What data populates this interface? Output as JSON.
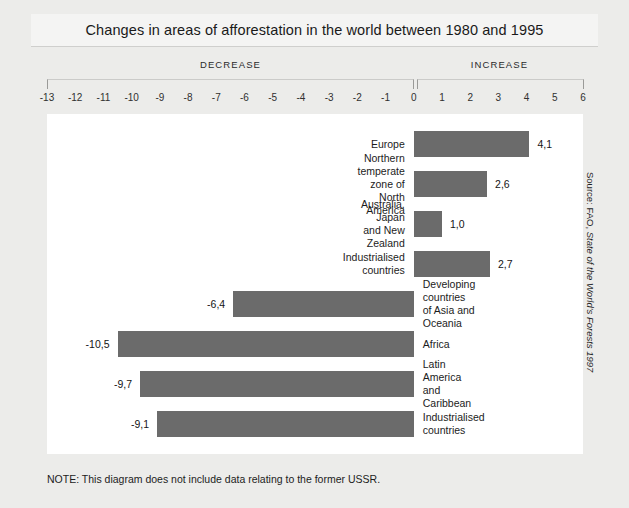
{
  "title": "Changes in areas of afforestation in the world between 1980 and 1995",
  "bands": {
    "decrease": "DECREASE",
    "increase": "INCREASE"
  },
  "note": "NOTE: This diagram does not include data relating to the former USSR.",
  "source_prefix": "Source: FAO, ",
  "source_italic": "State of the World's Forests 1997",
  "chart_data": {
    "type": "bar",
    "orientation": "horizontal",
    "title": "Changes in areas of afforestation in the world between 1980 and 1995",
    "xlabel": "",
    "ylabel": "",
    "xlim": [
      -13,
      6
    ],
    "grid": false,
    "legend": null,
    "bar_color": "#6b6b6b",
    "plot_background": "#ffffff",
    "figure_background": "#ececea",
    "tick_labels": [
      "-13",
      "-12",
      "-11",
      "-10",
      "-9",
      "-8",
      "-7",
      "-6",
      "-5",
      "-4",
      "-3",
      "-2",
      "-1",
      "0",
      "1",
      "2",
      "3",
      "4",
      "5",
      "6"
    ],
    "ticks": [
      -13,
      -12,
      -11,
      -10,
      -9,
      -8,
      -7,
      -6,
      -5,
      -4,
      -3,
      -2,
      -1,
      0,
      1,
      2,
      3,
      4,
      5,
      6
    ],
    "categories": [
      "Europe",
      "Northern temperate zone of North America",
      "Australia, Japan and New Zealand",
      "Industrialised countries",
      "Developing countries\nof Asia and Oceania",
      "Africa",
      "Latin America and Caribbean",
      "Industrialised countries"
    ],
    "values": [
      4.1,
      2.6,
      1.0,
      2.7,
      -6.4,
      -10.5,
      -9.7,
      -9.1
    ],
    "value_labels": [
      "4,1",
      "2,6",
      "1,0",
      "2,7",
      "-6,4",
      "-10,5",
      "-9,7",
      "-9,1"
    ],
    "annotations": [
      "NOTE: This diagram does not include data relating to the former USSR.",
      "Source: FAO, State of the World's Forests 1997"
    ]
  }
}
